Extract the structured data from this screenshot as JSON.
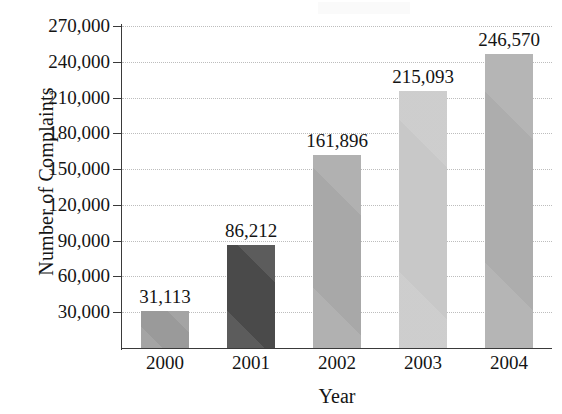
{
  "chart_data": {
    "type": "bar",
    "title": "",
    "subtitle": "",
    "xlabel": "Year",
    "ylabel": "Number of Complaints",
    "categories": [
      "2000",
      "2001",
      "2002",
      "2003",
      "2004"
    ],
    "values": [
      31113,
      86212,
      161896,
      215093,
      246570
    ],
    "value_labels": [
      "31,113",
      "86,212",
      "161,896",
      "215,093",
      "246,570"
    ],
    "bar_colors": [
      "#9a9a9a",
      "#4a4a4a",
      "#a8a8a8",
      "#c8c8c8",
      "#adadad"
    ],
    "ylim": [
      0,
      270000
    ],
    "ytick_values": [
      30000,
      60000,
      90000,
      120000,
      150000,
      180000,
      210000,
      240000,
      270000
    ],
    "ytick_labels": [
      "30,000",
      "60,000",
      "90,000",
      "120,000",
      "150,000",
      "180,000",
      "210,000",
      "240,000",
      "270,000"
    ],
    "grid": true,
    "grid_style": "dotted",
    "grid_color": "#bdbdbd",
    "legend": "none",
    "axis_color": "#3a3a3a",
    "text_color": "#141414"
  }
}
